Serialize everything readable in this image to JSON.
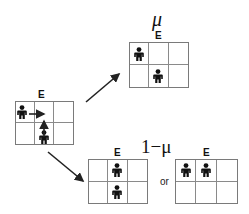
{
  "diagram": {
    "colors": {
      "line": "#7a7a7a",
      "ink": "#111111",
      "background": "#ffffff"
    },
    "initial_state": {
      "exit_label": "E",
      "occupied_cells": [
        "row1-col1",
        "row2-col2"
      ],
      "moves": [
        "row1-col1 -> right",
        "row2-col2 -> up"
      ]
    },
    "outcome_mu": {
      "probability_label": "μ",
      "exit_label": "E",
      "occupied_cells": [
        "row1-col1",
        "row2-col2"
      ]
    },
    "outcome_one_minus_mu": {
      "probability_label": "1−μ",
      "separator": "or",
      "option_a": {
        "exit_label": "E",
        "occupied_cells": [
          "row1-col2",
          "row2-col2"
        ]
      },
      "option_b": {
        "exit_label": "E",
        "occupied_cells": [
          "row1-col1",
          "row1-col2"
        ]
      }
    }
  }
}
